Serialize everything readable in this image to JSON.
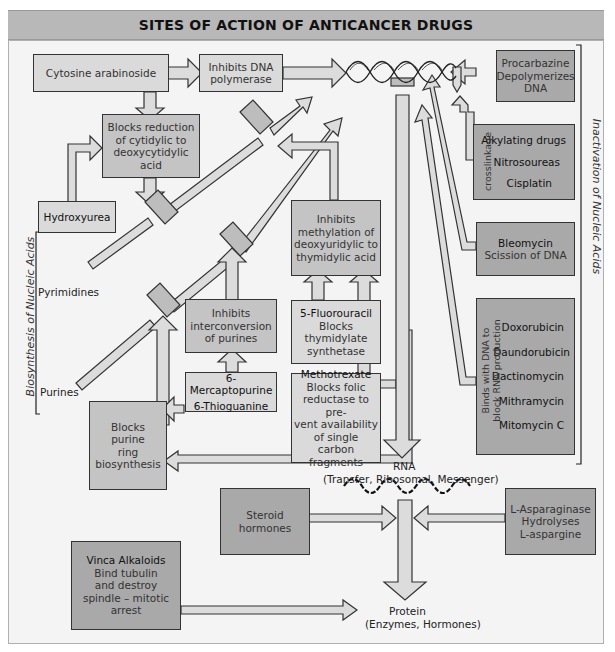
{
  "title": "SITES OF ACTION OF ANTICANCER DRUGS",
  "side_labels": {
    "left": "Biosynthesis of Nucleic Acids",
    "right": "Inactivation of Nucleic Acids"
  },
  "pathway_labels": {
    "pyrimidines": "Pyrimidines",
    "purines": "Purines",
    "rna": "RNA",
    "rna_types": "(Transfer, Ribosomal, Messenger)",
    "protein": "Protein",
    "protein_types": "(Enzymes, Hormones)"
  },
  "boxes": {
    "cytosine": {
      "line1": "Cytosine arabinoside"
    },
    "dna_polymerase": {
      "line1": "Inhibits DNA",
      "line2": "polymerase"
    },
    "cytidylic": {
      "line1": "Blocks reduction",
      "line2": "of cytidylic to",
      "line3": "deoxycytidylic acid"
    },
    "hydroxyurea": {
      "line1": "Hydroxyurea"
    },
    "methylation": {
      "line1": "Inhibits",
      "line2": "methylation of",
      "line3": "deoxyuridylic to",
      "line4": "thymidylic acid"
    },
    "interconversion": {
      "line1": "Inhibits",
      "line2": "interconversion",
      "line3": "of purines"
    },
    "fluorouracil": {
      "line1": "5-Fluorouracil",
      "line2": "Blocks",
      "line3": "thymidylate",
      "line4": "synthetase"
    },
    "mercaptopurine": {
      "line1": "6-Mercaptopurine",
      "line2": "6-Thioguanine"
    },
    "methotrexate": {
      "line1": "Methotrexate",
      "line2": "Blocks folic",
      "line3": "reductase to pre-",
      "line4": "vent availability",
      "line5": "of single carbon",
      "line6": "fragments"
    },
    "purine_ring": {
      "line1": "Blocks",
      "line2": "purine",
      "line3": "ring",
      "line4": "biosynthesis"
    },
    "procarbazine": {
      "line1": "Procarbazine",
      "line2": "Depolymerizes",
      "line3": "DNA"
    },
    "alkylating": {
      "side": "crosslinkage",
      "items": [
        "Alkylating drugs",
        "Nitrosoureas",
        "Cisplatin"
      ]
    },
    "bleomycin": {
      "line1": "Bleomycin",
      "line2": "Scission of DNA"
    },
    "antibiotics": {
      "side1": "Binds with DNA to",
      "side2": "block RNA production",
      "items": [
        "Doxorubicin",
        "Daundorubicin",
        "Dactinomycin",
        "Mithramycin",
        "Mitomycin C"
      ]
    },
    "steroid": {
      "line1": "Steroid",
      "line2": "hormones"
    },
    "asparaginase": {
      "line1": "L-Asparaginase",
      "line2": "Hydrolyses",
      "line3": "L-aspargine"
    },
    "vinca": {
      "line1": "Vinca Alkaloids",
      "line2": "Bind tubulin",
      "line3": "and destroy",
      "line4": "spindle – mitotic",
      "line5": "arrest"
    }
  },
  "colors": {
    "title_bar": "#b8b8b8",
    "panel": "#f4f4f4",
    "box_light": "#dadada",
    "box_mid": "#c4c4c4",
    "box_dark": "#a9a9a9",
    "arrow_fill": "#d8d8d8",
    "outline": "#333333"
  }
}
